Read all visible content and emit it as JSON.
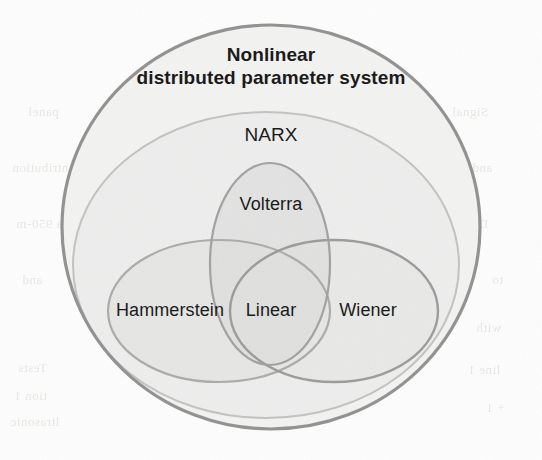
{
  "figure": {
    "type": "venn-diagram",
    "background_color": "#fdfdfc",
    "outer_stroke_color": "#2b2b2b",
    "inner_stroke_color": "#6e6e6e"
  },
  "labels": {
    "outer_line1": "Nonlinear",
    "outer_line2": "distributed parameter system",
    "narx": "NARX",
    "volterra": "Volterra",
    "hammerstein": "Hammerstein",
    "linear": "Linear",
    "wiener": "Wiener"
  },
  "sets": [
    {
      "id": "outer",
      "name": "Nonlinear distributed parameter system",
      "fill": "#e8e8e6",
      "stroke": "#2b2b2b",
      "stroke_width": 3.2,
      "cx": 271,
      "cy": 227,
      "rx": 209,
      "ry": 202
    },
    {
      "id": "narx",
      "name": "NARX",
      "fill": "#d9d9d6",
      "stroke": "#8a8a88",
      "stroke_width": 2.0,
      "cx": 266,
      "cy": 265,
      "rx": 193,
      "ry": 153
    },
    {
      "id": "volterra",
      "name": "Volterra",
      "fill": "#bcbcba",
      "stroke": "#4a4a4a",
      "stroke_width": 2.2,
      "cx": 270,
      "cy": 264,
      "rx": 60,
      "ry": 101
    },
    {
      "id": "hammerstein",
      "name": "Hammerstein",
      "fill": "#c6c6c3",
      "stroke": "#5c5c5a",
      "stroke_width": 2.2,
      "cx": 219,
      "cy": 311,
      "rx": 111,
      "ry": 71
    },
    {
      "id": "wiener",
      "name": "Wiener",
      "fill": "#cfcfcc",
      "stroke": "#3d3d3d",
      "stroke_width": 2.4,
      "cx": 334,
      "cy": 311,
      "rx": 104,
      "ry": 71
    }
  ],
  "bleed_through": [
    {
      "text": "panel",
      "x": 28,
      "y": 104
    },
    {
      "text": "ntribution",
      "x": 12,
      "y": 160
    },
    {
      "text": "a 950-m",
      "x": 16,
      "y": 216
    },
    {
      "text": "and",
      "x": 22,
      "y": 272
    },
    {
      "text": "Tests",
      "x": 18,
      "y": 360
    },
    {
      "text": "tion 1",
      "x": 14,
      "y": 388
    },
    {
      "text": "ltrasonic",
      "x": 10,
      "y": 414
    },
    {
      "text": "Signal",
      "x": 452,
      "y": 104
    },
    {
      "text": "and",
      "x": 472,
      "y": 160
    },
    {
      "text": "DISP",
      "x": 458,
      "y": 216
    },
    {
      "text": "to",
      "x": 492,
      "y": 272
    },
    {
      "text": "with",
      "x": 476,
      "y": 320
    },
    {
      "text": "line 1",
      "x": 468,
      "y": 362
    },
    {
      "text": "+ 1",
      "x": 486,
      "y": 400
    }
  ]
}
